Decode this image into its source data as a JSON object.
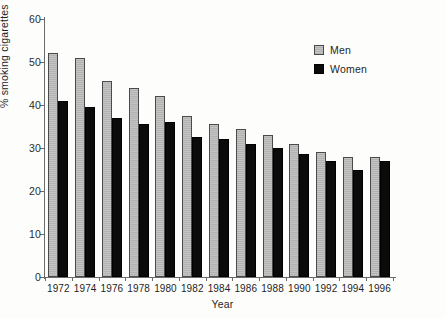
{
  "chart_data": {
    "type": "bar",
    "title": "",
    "subtitle": "",
    "xlabel": "Year",
    "ylabel": "% smoking cigarettes",
    "categories": [
      "1972",
      "1974",
      "1976",
      "1978",
      "1980",
      "1982",
      "1984",
      "1986",
      "1988",
      "1990",
      "1992",
      "1994",
      "1996"
    ],
    "series": [
      {
        "name": "Men",
        "color": "#b3b3b3",
        "values": [
          52.0,
          51.0,
          45.5,
          44.0,
          42.0,
          37.5,
          35.5,
          34.5,
          33.0,
          31.0,
          29.0,
          28.0,
          28.0
        ]
      },
      {
        "name": "Women",
        "color": "#0b0b0b",
        "values": [
          41.0,
          39.5,
          37.0,
          35.5,
          36.0,
          32.5,
          32.0,
          31.0,
          30.0,
          28.5,
          27.0,
          25.0,
          27.0
        ]
      }
    ],
    "ylim": [
      0,
      60
    ],
    "yticks": [
      0,
      10,
      20,
      30,
      40,
      50,
      60
    ],
    "ytick_labels": [
      "0",
      "10",
      "20",
      "30",
      "40",
      "50",
      "60"
    ],
    "grid": false,
    "legend_position": "top-right"
  },
  "legend": {
    "items": [
      {
        "label": "Men",
        "swatch": "gray-swatch-icon"
      },
      {
        "label": "Women",
        "swatch": "black-swatch-icon"
      }
    ]
  }
}
